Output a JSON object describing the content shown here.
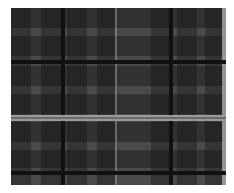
{
  "image": {
    "subject": "plaid fabric",
    "colors": {
      "base": "#4a4a4a",
      "dark_stripe": "#111111",
      "light_stripe": "#9a9a9a",
      "background": "#ffffff"
    }
  }
}
